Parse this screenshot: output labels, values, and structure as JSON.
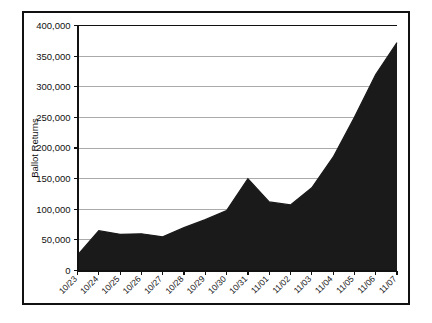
{
  "chart_data": {
    "type": "area",
    "title": "",
    "xlabel": "",
    "ylabel": "Ballot Returns",
    "categories": [
      "10/23",
      "10/24",
      "10/25",
      "10/26",
      "10/27",
      "10/28",
      "10/29",
      "10/30",
      "10/31",
      "11/01",
      "11/02",
      "11/03",
      "11/04",
      "11/05",
      "11/06",
      "11/07"
    ],
    "values": [
      25000,
      65000,
      59000,
      60000,
      55000,
      70000,
      83000,
      98000,
      150000,
      112000,
      107000,
      135000,
      185000,
      250000,
      320000,
      372000
    ],
    "series": [
      {
        "name": "Ballot Returns",
        "values": [
          25000,
          65000,
          59000,
          60000,
          55000,
          70000,
          83000,
          98000,
          150000,
          112000,
          107000,
          135000,
          185000,
          250000,
          320000,
          372000
        ]
      }
    ],
    "ylim": [
      0,
      400000
    ],
    "yticks": [
      0,
      50000,
      100000,
      150000,
      200000,
      250000,
      300000,
      350000,
      400000
    ],
    "ytick_labels": [
      "0",
      "50,000",
      "100,000",
      "150,000",
      "200,000",
      "250,000",
      "300,000",
      "350,000",
      "400,000"
    ],
    "grid": true,
    "legend": false,
    "legend_position": "none",
    "fill_color": "#1a1a1a",
    "line_color": "#1a1a1a",
    "grid_color": "#aaaaaa",
    "axis_color": "#111111",
    "background_color": "#ffffff",
    "xtick_rotation": 45
  },
  "figure": {
    "border_color": "#111111",
    "background_color": "#ffffff"
  }
}
